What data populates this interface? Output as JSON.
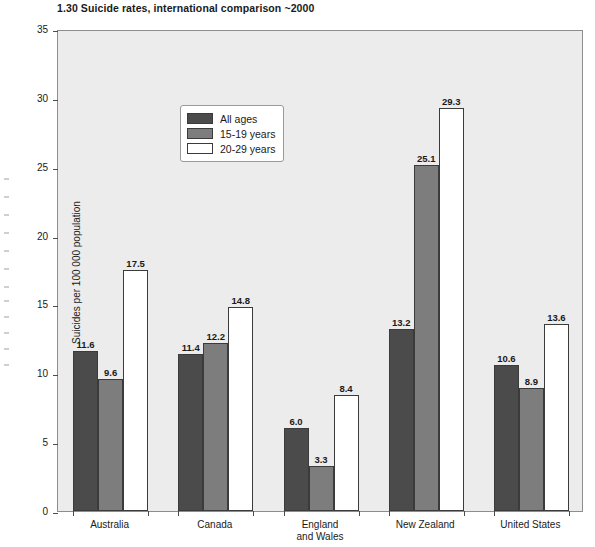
{
  "figure": {
    "number": "1.30",
    "title": "1.30  Suicide rates, international comparison ~2000"
  },
  "chart_data": {
    "type": "bar",
    "title": "1.30  Suicide rates, international comparison ~2000",
    "xlabel": "",
    "ylabel": "Suicides per 100 000 population",
    "ylim": [
      0,
      35
    ],
    "yticks": [
      0,
      5,
      10,
      15,
      20,
      25,
      30,
      35
    ],
    "ytick_labels": [
      "0",
      "5",
      "10",
      "15",
      "20",
      "25",
      "30",
      "35"
    ],
    "grid": false,
    "legend_position": "upper left inside",
    "categories": [
      "Australia",
      "Canada",
      "England\nand Wales",
      "New Zealand",
      "United States"
    ],
    "category_labels": [
      "Australia",
      "Canada",
      "England\nand Wales",
      "New Zealand",
      "United States"
    ],
    "series": [
      {
        "name": "All ages",
        "color": "#4b4b4b",
        "values": [
          11.6,
          11.4,
          6.0,
          13.2,
          10.6
        ],
        "value_labels": [
          "11.6",
          "11.4",
          "6.0",
          "13.2",
          "10.6"
        ]
      },
      {
        "name": "15-19 years",
        "color": "#7d7d7d",
        "values": [
          9.6,
          12.2,
          3.3,
          25.1,
          8.9
        ],
        "value_labels": [
          "9.6",
          "12.2",
          "3.3",
          "25.1",
          "8.9"
        ]
      },
      {
        "name": "20-29 years",
        "color": "#ffffff",
        "values": [
          17.5,
          14.8,
          8.4,
          29.3,
          13.6
        ],
        "value_labels": [
          "17.5",
          "14.8",
          "8.4",
          "29.3",
          "13.6"
        ]
      }
    ]
  },
  "legend": {
    "items": [
      {
        "label": "All ages",
        "swatch": "all-ages"
      },
      {
        "label": "15-19 years",
        "swatch": "teen"
      },
      {
        "label": "20-29 years",
        "swatch": "twenties"
      }
    ]
  },
  "colors": {
    "all_ages": "#4b4b4b",
    "teen": "#7d7d7d",
    "twenties": "#ffffff",
    "plot_background": "#ececec",
    "axis": "#4d4d4d",
    "text": "#1a1a1a"
  }
}
